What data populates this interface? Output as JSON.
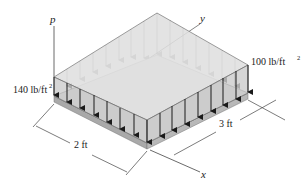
{
  "diagram": {
    "labels": {
      "pressure_axis": "p",
      "y_axis": "y",
      "x_axis": "x",
      "load_left": "140 lb/ft",
      "load_right": "100 lb/ft",
      "exponent": "2",
      "dim_width": "2 ft",
      "dim_length": "3 ft"
    },
    "colors": {
      "plate_top": "#d9d9d9",
      "plate_edge": "#a9a9a9",
      "load_fill": "#e4e4e4",
      "load_side": "#c8c8c8",
      "arrow_dark": "#1a1a1a",
      "arrow_light": "#7a7a7a",
      "line": "#444444"
    },
    "loads": {
      "max_intensity": 140,
      "min_intensity": 100,
      "unit": "lb/ft^2"
    },
    "dimensions": {
      "width_ft": 2,
      "length_ft": 3
    }
  }
}
